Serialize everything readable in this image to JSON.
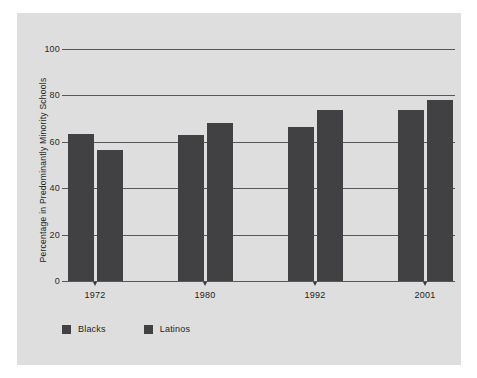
{
  "chart_data": {
    "type": "bar",
    "title": "",
    "subtitle": "",
    "xlabel": "",
    "ylabel": "Percentage in Predominantly Minority Schools",
    "categories": [
      "1972",
      "1980",
      "1992",
      "2001"
    ],
    "series": [
      {
        "name": "Blacks",
        "color": "#414042",
        "values": [
          63.4,
          63.0,
          66.4,
          73.7
        ]
      },
      {
        "name": "Latinos",
        "color": "#414042",
        "values": [
          56.5,
          68.0,
          73.7,
          78.0
        ]
      }
    ],
    "ylim": [
      0,
      100
    ],
    "yticks": [
      0,
      20,
      40,
      60,
      80,
      100
    ],
    "ytick_labels": [
      "0",
      "20",
      "40",
      "60",
      "80",
      "100"
    ],
    "grid": true,
    "legend_position": "bottom-left",
    "panel_color": "#dedede",
    "grid_color": "#58585a",
    "text_color": "#1d1d1d"
  }
}
